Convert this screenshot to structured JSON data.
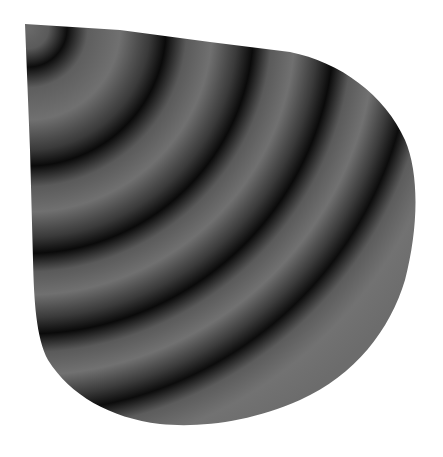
{
  "figure": {
    "background": "#ffffff",
    "fringe_light": "#6e6e6e",
    "fringe_dark": "#0a0a0a",
    "fringe_center": [
      28,
      28
    ],
    "fringe_count": 6
  }
}
